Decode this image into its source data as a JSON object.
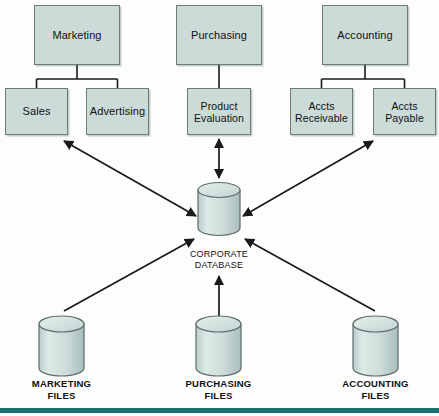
{
  "diagram": {
    "colors": {
      "box_fill": "#cbdbd8",
      "box_stroke": "#6d7b79",
      "cylinder_fill": "#cfdedb",
      "cylinder_stroke": "#5d6b6b",
      "line": "#1a1a1a",
      "bottom_band": "#18726f",
      "background": "#fdfdfd"
    },
    "departments": [
      {
        "id": "marketing",
        "label": "Marketing",
        "children": [
          {
            "id": "sales",
            "label": "Sales"
          },
          {
            "id": "advertising",
            "label": "Advertising"
          }
        ]
      },
      {
        "id": "purchasing",
        "label": "Purchasing",
        "children": [
          {
            "id": "product-evaluation",
            "label": "Product\nEvaluation"
          }
        ]
      },
      {
        "id": "accounting",
        "label": "Accounting",
        "children": [
          {
            "id": "accts-receivable",
            "label": "Accts\nReceivable"
          },
          {
            "id": "accts-payable",
            "label": "Accts\nPayable"
          }
        ]
      }
    ],
    "central_store": {
      "id": "corporate-database",
      "label": "CORPORATE\nDATABASE",
      "shape": "cylinder"
    },
    "file_stores": [
      {
        "id": "marketing-files",
        "label": "MARKETING\nFILES",
        "shape": "cylinder"
      },
      {
        "id": "purchasing-files",
        "label": "PURCHASING\nFILES",
        "shape": "cylinder"
      },
      {
        "id": "accounting-files",
        "label": "ACCOUNTING\nFILES",
        "shape": "cylinder"
      }
    ],
    "connections": [
      {
        "id": "sales-advertising-to-database",
        "from": "marketing-branch",
        "to": "corporate-database",
        "arrow": "double"
      },
      {
        "id": "product-evaluation-to-database",
        "from": "product-evaluation",
        "to": "corporate-database",
        "arrow": "double"
      },
      {
        "id": "accounting-branch-to-database",
        "from": "accounting-branch",
        "to": "corporate-database",
        "arrow": "double"
      },
      {
        "id": "marketing-files-to-database",
        "from": "marketing-files",
        "to": "corporate-database",
        "arrow": "single"
      },
      {
        "id": "purchasing-files-to-database",
        "from": "purchasing-files",
        "to": "corporate-database",
        "arrow": "single"
      },
      {
        "id": "accounting-files-to-database",
        "from": "accounting-files",
        "to": "corporate-database",
        "arrow": "single"
      }
    ]
  }
}
